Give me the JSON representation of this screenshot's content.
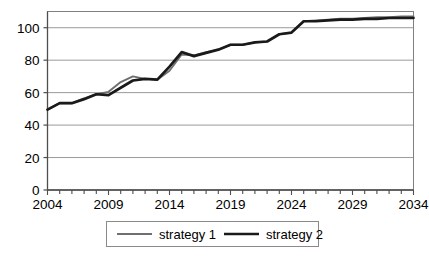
{
  "chart_data": {
    "type": "line",
    "title": "",
    "xlabel": "",
    "ylabel": "",
    "xlim": [
      2004,
      2034
    ],
    "ylim": [
      0,
      110
    ],
    "yticks": [
      0,
      20,
      40,
      60,
      80,
      100
    ],
    "ytick_labels": [
      "0",
      "20",
      "40",
      "60",
      "80",
      "100"
    ],
    "xticks": [
      2004,
      2009,
      2014,
      2019,
      2024,
      2029,
      2034
    ],
    "xtick_labels": [
      "2004",
      "2009",
      "2014",
      "2019",
      "2024",
      "2029",
      "2034"
    ],
    "x_minor_tick_interval": 1,
    "grid": "horizontal",
    "legend_position": "bottom-center",
    "x": [
      2004,
      2005,
      2006,
      2007,
      2008,
      2009,
      2010,
      2011,
      2012,
      2013,
      2014,
      2015,
      2016,
      2017,
      2018,
      2019,
      2020,
      2021,
      2022,
      2023,
      2024,
      2025,
      2026,
      2027,
      2028,
      2029,
      2030,
      2031,
      2032,
      2033,
      2034
    ],
    "series": [
      {
        "name": "strategy 1",
        "color": "#6f6f6f",
        "line_width": 1.9,
        "values": [
          49.5,
          53.5,
          53.5,
          56.5,
          59.0,
          60.5,
          66.5,
          70.0,
          68.5,
          68.0,
          73.5,
          83.5,
          83.0,
          85.0,
          86.5,
          89.5,
          89.5,
          91.0,
          91.5,
          96.0,
          97.0,
          104.0,
          104.5,
          105.0,
          105.5,
          105.5,
          106.0,
          106.5,
          106.5,
          107.0,
          107.0
        ]
      },
      {
        "name": "strategy 2",
        "color": "#1a1a1a",
        "line_width": 2.7,
        "values": [
          49.5,
          53.5,
          53.5,
          56.0,
          59.0,
          58.5,
          63.0,
          67.5,
          68.5,
          68.0,
          76.0,
          85.0,
          82.5,
          84.5,
          86.5,
          89.5,
          89.5,
          91.0,
          91.5,
          96.0,
          97.0,
          104.0,
          104.0,
          104.5,
          105.0,
          105.0,
          105.5,
          105.5,
          106.0,
          106.0,
          106.0
        ]
      }
    ],
    "legend": [
      {
        "label": "strategy 1",
        "color": "#6f6f6f",
        "line_width": 1.9
      },
      {
        "label": "strategy 2",
        "color": "#1a1a1a",
        "line_width": 2.7
      }
    ]
  },
  "colors": {
    "plot_border": "#808080",
    "gridline": "#9a9a9a",
    "axis": "#4d4d4d",
    "legend_border": "#8a8a8a",
    "background": "#ffffff"
  }
}
